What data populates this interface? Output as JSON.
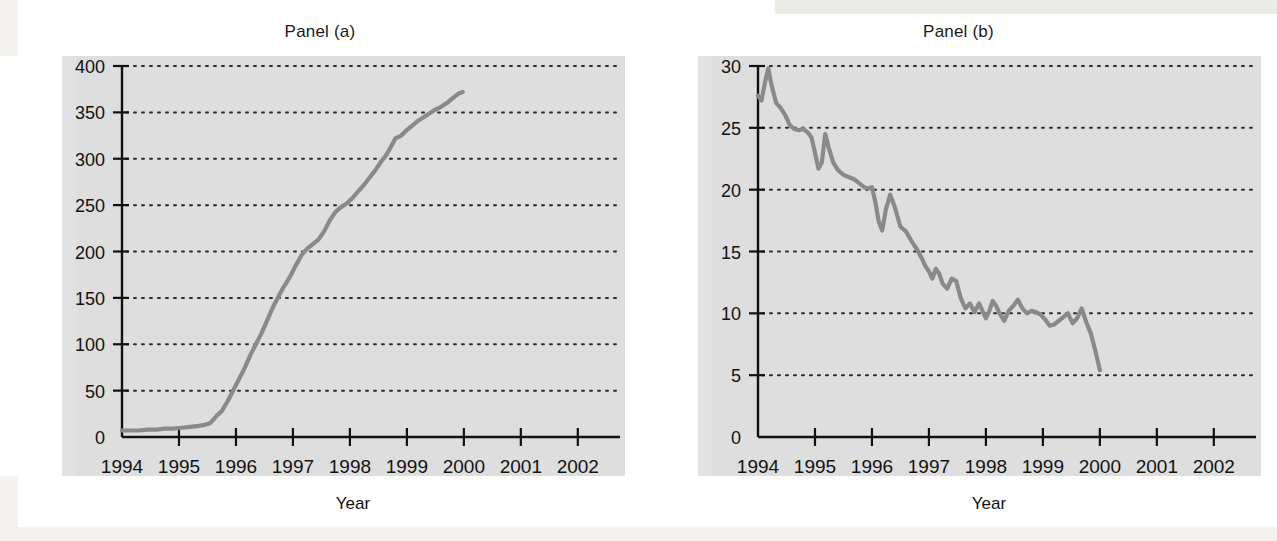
{
  "figure": {
    "background_color": "#ffffff",
    "plot_background_color": "#dedede",
    "line_color": "#8a8a8a",
    "axis_color": "#111111",
    "grid_color": "#2b2b2b"
  },
  "panels": [
    {
      "title": "Panel (a)",
      "ylabel": "Sweep Accounts ($ billions)",
      "xlabel": "Year"
    },
    {
      "title": "Panel (b)",
      "ylabel_line1": "Reserve Balances in",
      "ylabel_line2": "Federal Reserve Banks ($ billions)",
      "xlabel": "Year"
    }
  ],
  "chart_data": [
    {
      "type": "line",
      "title": "Panel (a)",
      "xlabel": "Year",
      "ylabel": "Sweep Accounts ($ billions)",
      "xlim": [
        1994,
        2002.6
      ],
      "ylim": [
        0,
        400
      ],
      "xticks": [
        1994,
        1995,
        1996,
        1997,
        1998,
        1999,
        2000,
        2001,
        2002
      ],
      "xtick_labels": [
        "1994",
        "1995",
        "1996",
        "1997",
        "1998",
        "1999",
        "2000",
        "2001",
        "2002"
      ],
      "yticks": [
        0,
        50,
        100,
        150,
        200,
        250,
        300,
        350,
        400
      ],
      "ytick_labels": [
        "0",
        "50",
        "100",
        "150",
        "200",
        "250",
        "300",
        "350",
        "400"
      ],
      "grid": "horizontal-dotted",
      "legend": null,
      "series": [
        {
          "name": "Sweep Accounts",
          "x": [
            1994.0,
            1994.15,
            1994.3,
            1994.45,
            1994.6,
            1994.75,
            1994.9,
            1995.05,
            1995.2,
            1995.35,
            1995.45,
            1995.55,
            1995.65,
            1995.75,
            1995.85,
            1995.95,
            1996.05,
            1996.15,
            1996.25,
            1996.35,
            1996.45,
            1996.55,
            1996.65,
            1996.75,
            1996.85,
            1996.95,
            1997.05,
            1997.15,
            1997.25,
            1997.35,
            1997.45,
            1997.55,
            1997.65,
            1997.75,
            1997.85,
            1997.95,
            1998.05,
            1998.15,
            1998.25,
            1998.35,
            1998.45,
            1998.55,
            1998.65,
            1998.72,
            1998.8,
            1998.9,
            1999.0,
            1999.1,
            1999.2,
            1999.3,
            1999.4,
            1999.5,
            1999.6,
            1999.7,
            1999.8,
            1999.9,
            1999.98
          ],
          "y": [
            7,
            7,
            7,
            8,
            8,
            9,
            9,
            10,
            11,
            12,
            13,
            15,
            22,
            28,
            38,
            50,
            62,
            74,
            88,
            100,
            112,
            126,
            140,
            152,
            163,
            173,
            185,
            196,
            203,
            208,
            213,
            222,
            234,
            243,
            248,
            252,
            258,
            265,
            272,
            280,
            288,
            297,
            305,
            313,
            322,
            325,
            331,
            336,
            341,
            345,
            349,
            353,
            356,
            360,
            365,
            370,
            372
          ]
        }
      ]
    },
    {
      "type": "line",
      "title": "Panel (b)",
      "xlabel": "Year",
      "ylabel": "Reserve Balances in Federal Reserve Banks ($ billions)",
      "xlim": [
        1994,
        2002.6
      ],
      "ylim": [
        0,
        30
      ],
      "xticks": [
        1994,
        1995,
        1996,
        1997,
        1998,
        1999,
        2000,
        2001,
        2002
      ],
      "xtick_labels": [
        "1994",
        "1995",
        "1996",
        "1997",
        "1998",
        "1999",
        "2000",
        "2001",
        "2002"
      ],
      "yticks": [
        0,
        5,
        10,
        15,
        20,
        25,
        30
      ],
      "ytick_labels": [
        "0",
        "5",
        "10",
        "15",
        "20",
        "25",
        "30"
      ],
      "grid": "horizontal-dotted",
      "legend": null,
      "series": [
        {
          "name": "Reserve Balances",
          "x": [
            1994.0,
            1994.06,
            1994.12,
            1994.18,
            1994.24,
            1994.32,
            1994.4,
            1994.48,
            1994.56,
            1994.64,
            1994.72,
            1994.8,
            1994.88,
            1994.94,
            1995.0,
            1995.06,
            1995.12,
            1995.18,
            1995.24,
            1995.32,
            1995.4,
            1995.5,
            1995.6,
            1995.7,
            1995.78,
            1995.86,
            1995.94,
            1996.0,
            1996.06,
            1996.12,
            1996.18,
            1996.24,
            1996.32,
            1996.4,
            1996.5,
            1996.6,
            1996.7,
            1996.8,
            1996.88,
            1996.94,
            1997.0,
            1997.06,
            1997.12,
            1997.18,
            1997.24,
            1997.32,
            1997.4,
            1997.48,
            1997.56,
            1997.64,
            1997.72,
            1997.8,
            1997.88,
            1997.94,
            1998.0,
            1998.06,
            1998.12,
            1998.18,
            1998.24,
            1998.32,
            1998.4,
            1998.48,
            1998.56,
            1998.64,
            1998.72,
            1998.8,
            1998.88,
            1998.96,
            1999.04,
            1999.12,
            1999.2,
            1999.28,
            1999.36,
            1999.44,
            1999.52,
            1999.6,
            1999.68,
            1999.76,
            1999.84,
            1999.92,
            2000.0
          ],
          "y": [
            27.6,
            27.2,
            28.6,
            29.8,
            28.4,
            27.0,
            26.6,
            26.0,
            25.2,
            24.9,
            24.8,
            24.9,
            24.6,
            24.2,
            23.0,
            21.7,
            22.2,
            24.5,
            23.4,
            22.2,
            21.6,
            21.2,
            21.0,
            20.8,
            20.5,
            20.2,
            20.1,
            20.2,
            19.0,
            17.4,
            16.7,
            18.3,
            19.6,
            18.6,
            17.0,
            16.6,
            15.8,
            15.1,
            14.4,
            13.8,
            13.4,
            12.8,
            13.6,
            13.2,
            12.4,
            12.0,
            12.8,
            12.6,
            11.2,
            10.4,
            10.8,
            10.1,
            10.8,
            10.2,
            9.6,
            10.2,
            11.0,
            10.6,
            10.0,
            9.4,
            10.2,
            10.6,
            11.1,
            10.4,
            10.0,
            10.2,
            10.1,
            9.9,
            9.5,
            9.0,
            9.1,
            9.4,
            9.7,
            10.0,
            9.2,
            9.6,
            10.4,
            9.3,
            8.4,
            7.0,
            5.4
          ]
        }
      ]
    }
  ]
}
